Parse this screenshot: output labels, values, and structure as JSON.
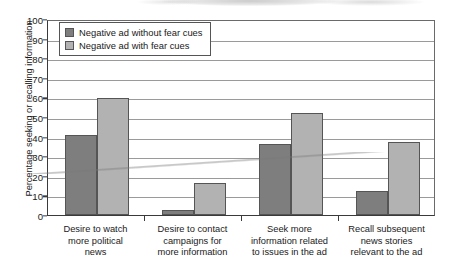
{
  "chart_data": {
    "type": "bar",
    "title": "",
    "xlabel": "",
    "ylabel": "Percentage seeking or recalling information",
    "ylim": [
      0,
      100
    ],
    "ytick_step": 10,
    "yticks": [
      "0",
      "10",
      "20",
      "30",
      "40",
      "50",
      "60",
      "70",
      "80",
      "90",
      "100"
    ],
    "grid": "horizontal",
    "legend_position": "top-left inside plot",
    "categories": [
      "Desire to watch more political news",
      "Desire to contact campaigns for more information",
      "Seek more information related to issues in the ad",
      "Recall subsequent news stories relevant to the ad"
    ],
    "category_lines": [
      [
        "Desire to watch",
        "more political",
        "news"
      ],
      [
        "Desire to contact",
        "campaigns for",
        "more information"
      ],
      [
        "Seek more",
        "information related",
        "to issues in the ad"
      ],
      [
        "Recall subsequent",
        "news stories",
        "relevant to the ad"
      ]
    ],
    "series": [
      {
        "name": "Negative ad without fear cues",
        "color": "#7e7e7e",
        "values": [
          41,
          2.5,
          36,
          12.5
        ]
      },
      {
        "name": "Negative ad with fear cues",
        "color": "#b2b2b2",
        "values": [
          59.5,
          16.5,
          52,
          37.5
        ]
      }
    ]
  }
}
